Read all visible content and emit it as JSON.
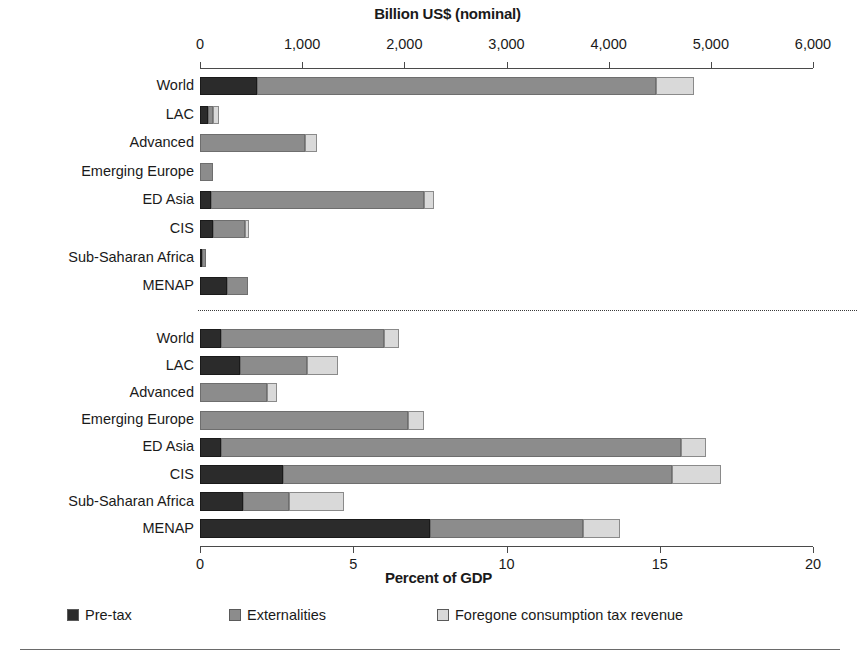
{
  "chart_data": {
    "type": "bar",
    "orientation": "horizontal",
    "stacked": true,
    "grid": false,
    "legend_position": "bottom",
    "title": "",
    "panels": [
      {
        "id": "nominal",
        "xlabel": "Billion US$ (nominal)",
        "xlim": [
          0,
          6000
        ],
        "xticks": [
          0,
          1000,
          2000,
          3000,
          4000,
          5000,
          6000
        ],
        "xticklabels": [
          "0",
          "1,000",
          "2,000",
          "3,000",
          "4,000",
          "5,000",
          "6,000"
        ],
        "categories": [
          "World",
          "LAC",
          "Advanced",
          "Emerging Europe",
          "ED Asia",
          "CIS",
          "Sub-Saharan Africa",
          "MENAP"
        ],
        "series": [
          {
            "name": "Pre-tax",
            "color": "#2b2b2b",
            "values": [
              555,
              80,
              0,
              0,
              110,
              130,
              20,
              265
            ]
          },
          {
            "name": "Externalities",
            "color": "#8c8c8c",
            "values": [
              3910,
              45,
              1025,
              130,
              2080,
              310,
              35,
              205
            ]
          },
          {
            "name": "Foregone consumption tax revenue",
            "color": "#d9d9d9",
            "values": [
              372,
              60,
              125,
              0,
              100,
              40,
              0,
              0
            ]
          }
        ],
        "totals": [
          4837,
          185,
          1150,
          130,
          2290,
          480,
          55,
          470
        ]
      },
      {
        "id": "percent_gdp",
        "xlabel": "Percent of GDP",
        "xlim": [
          0,
          20
        ],
        "xticks": [
          0,
          5,
          10,
          15,
          20
        ],
        "xticklabels": [
          "0",
          "5",
          "10",
          "15",
          "20"
        ],
        "categories": [
          "World",
          "LAC",
          "Advanced",
          "Emerging Europe",
          "ED Asia",
          "CIS",
          "Sub-Saharan Africa",
          "MENAP"
        ],
        "series": [
          {
            "name": "Pre-tax",
            "color": "#2b2b2b",
            "values": [
              0.7,
              1.3,
              0.0,
              0.0,
              0.7,
              2.7,
              1.4,
              7.5
            ]
          },
          {
            "name": "Externalities",
            "color": "#8c8c8c",
            "values": [
              5.3,
              2.2,
              2.2,
              6.8,
              15.0,
              12.7,
              1.5,
              5.0
            ]
          },
          {
            "name": "Foregone consumption tax revenue",
            "color": "#d9d9d9",
            "values": [
              0.5,
              1.0,
              0.3,
              0.5,
              0.8,
              1.6,
              1.8,
              1.2
            ]
          }
        ],
        "totals": [
          6.5,
          4.5,
          2.5,
          7.3,
          16.5,
          17.0,
          4.7,
          13.7
        ]
      }
    ],
    "legend": [
      {
        "label": "Pre-tax",
        "color": "#2b2b2b"
      },
      {
        "label": "Externalities",
        "color": "#8c8c8c"
      },
      {
        "label": "Foregone consumption tax revenue",
        "color": "#d9d9d9"
      }
    ]
  }
}
